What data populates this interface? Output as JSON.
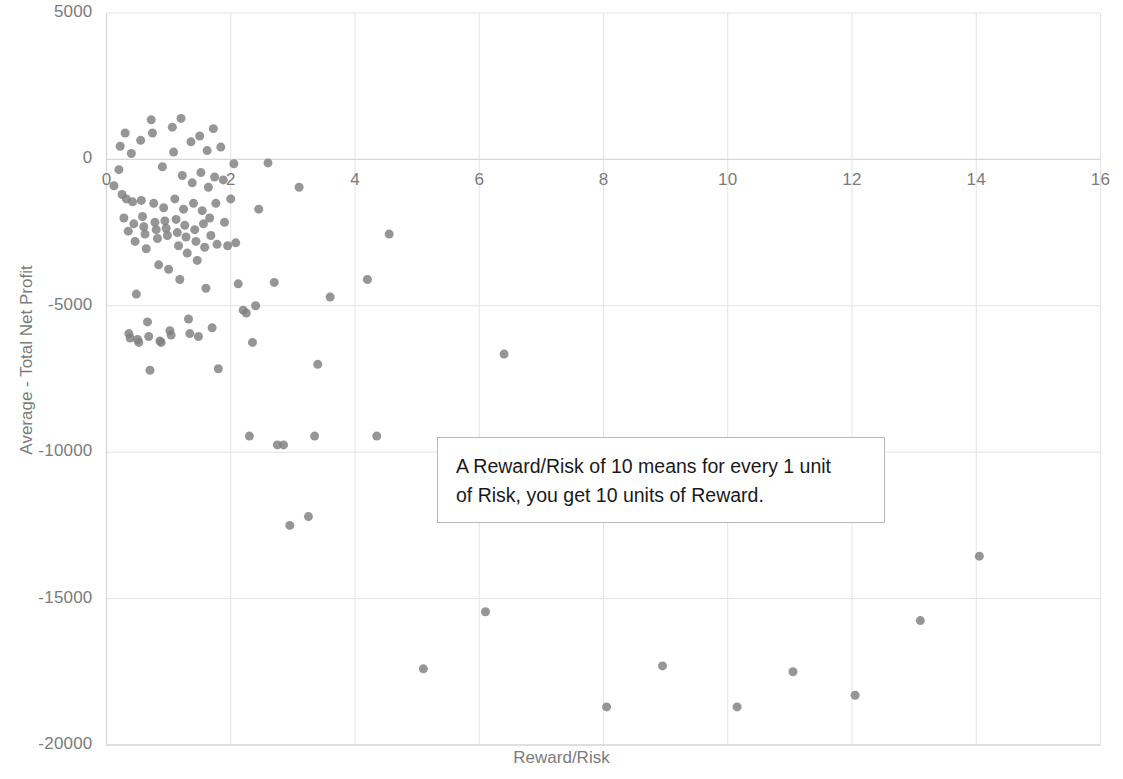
{
  "chart_data": {
    "type": "scatter",
    "title": "",
    "xlabel": "Reward/Risk",
    "ylabel": "Average - Total Net Profit",
    "xlim": [
      0,
      16
    ],
    "ylim": [
      -20000,
      5000
    ],
    "x_ticks": [
      "0",
      "2",
      "4",
      "6",
      "8",
      "10",
      "12",
      "14",
      "16"
    ],
    "x_tick_values": [
      0,
      2,
      4,
      6,
      8,
      10,
      12,
      14,
      16
    ],
    "y_ticks": [
      "5000",
      "0",
      "-5000",
      "-10000",
      "-15000",
      "-20000"
    ],
    "y_tick_values": [
      5000,
      0,
      -5000,
      -10000,
      -15000,
      -20000
    ],
    "grid": true,
    "legend": "none",
    "marker_color": "#7f7f7f",
    "marker_size": 9,
    "points": [
      [
        0.12,
        -900
      ],
      [
        0.2,
        -350
      ],
      [
        0.22,
        450
      ],
      [
        0.25,
        -1200
      ],
      [
        0.28,
        -2000
      ],
      [
        0.3,
        900
      ],
      [
        0.32,
        -1350
      ],
      [
        0.35,
        -2450
      ],
      [
        0.36,
        -5950
      ],
      [
        0.38,
        -6100
      ],
      [
        0.4,
        200
      ],
      [
        0.42,
        -1450
      ],
      [
        0.44,
        -2200
      ],
      [
        0.46,
        -2800
      ],
      [
        0.48,
        -4600
      ],
      [
        0.5,
        -6150
      ],
      [
        0.52,
        -6250
      ],
      [
        0.55,
        650
      ],
      [
        0.56,
        -1400
      ],
      [
        0.58,
        -1950
      ],
      [
        0.6,
        -2300
      ],
      [
        0.62,
        -2550
      ],
      [
        0.64,
        -3050
      ],
      [
        0.66,
        -5550
      ],
      [
        0.68,
        -6050
      ],
      [
        0.7,
        -7200
      ],
      [
        0.72,
        1350
      ],
      [
        0.74,
        900
      ],
      [
        0.76,
        -1500
      ],
      [
        0.78,
        -2150
      ],
      [
        0.8,
        -2400
      ],
      [
        0.82,
        -2700
      ],
      [
        0.84,
        -3600
      ],
      [
        0.86,
        -6200
      ],
      [
        0.88,
        -6250
      ],
      [
        0.9,
        -250
      ],
      [
        0.92,
        -1650
      ],
      [
        0.94,
        -2100
      ],
      [
        0.96,
        -2350
      ],
      [
        0.98,
        -2600
      ],
      [
        1.0,
        -3750
      ],
      [
        1.02,
        -5850
      ],
      [
        1.04,
        -6000
      ],
      [
        1.06,
        1100
      ],
      [
        1.08,
        250
      ],
      [
        1.1,
        -1350
      ],
      [
        1.12,
        -2050
      ],
      [
        1.14,
        -2500
      ],
      [
        1.16,
        -2950
      ],
      [
        1.18,
        -4100
      ],
      [
        1.2,
        1400
      ],
      [
        1.22,
        -550
      ],
      [
        1.24,
        -1700
      ],
      [
        1.26,
        -2250
      ],
      [
        1.28,
        -2650
      ],
      [
        1.3,
        -3200
      ],
      [
        1.32,
        -5450
      ],
      [
        1.34,
        -5950
      ],
      [
        1.36,
        600
      ],
      [
        1.38,
        -800
      ],
      [
        1.4,
        -1500
      ],
      [
        1.42,
        -2400
      ],
      [
        1.44,
        -2800
      ],
      [
        1.46,
        -3450
      ],
      [
        1.48,
        -6050
      ],
      [
        1.5,
        800
      ],
      [
        1.52,
        -450
      ],
      [
        1.54,
        -1750
      ],
      [
        1.56,
        -2200
      ],
      [
        1.58,
        -3000
      ],
      [
        1.6,
        -4400
      ],
      [
        1.62,
        300
      ],
      [
        1.64,
        -950
      ],
      [
        1.66,
        -2000
      ],
      [
        1.68,
        -2600
      ],
      [
        1.7,
        -5750
      ],
      [
        1.72,
        1050
      ],
      [
        1.74,
        -600
      ],
      [
        1.76,
        -1500
      ],
      [
        1.78,
        -2900
      ],
      [
        1.8,
        -7150
      ],
      [
        1.84,
        420
      ],
      [
        1.88,
        -700
      ],
      [
        1.9,
        -2150
      ],
      [
        1.95,
        -2950
      ],
      [
        2.0,
        -1350
      ],
      [
        2.05,
        -150
      ],
      [
        2.08,
        -2850
      ],
      [
        2.12,
        -4250
      ],
      [
        2.2,
        -5150
      ],
      [
        2.25,
        -5250
      ],
      [
        2.3,
        -9450
      ],
      [
        2.35,
        -6250
      ],
      [
        2.4,
        -5000
      ],
      [
        2.45,
        -1700
      ],
      [
        2.6,
        -120
      ],
      [
        2.7,
        -4200
      ],
      [
        2.75,
        -9750
      ],
      [
        2.85,
        -9750
      ],
      [
        2.95,
        -12500
      ],
      [
        3.1,
        -950
      ],
      [
        3.25,
        -12200
      ],
      [
        3.35,
        -9450
      ],
      [
        3.4,
        -7000
      ],
      [
        3.6,
        -4700
      ],
      [
        4.2,
        -4100
      ],
      [
        4.35,
        -9450
      ],
      [
        4.55,
        -2550
      ],
      [
        5.1,
        -17400
      ],
      [
        6.4,
        -6650
      ],
      [
        6.1,
        -15450
      ],
      [
        8.05,
        -18700
      ],
      [
        8.95,
        -17300
      ],
      [
        10.15,
        -18700
      ],
      [
        11.05,
        -17500
      ],
      [
        12.05,
        -18300
      ],
      [
        13.1,
        -15750
      ],
      [
        14.05,
        -13550
      ]
    ]
  },
  "annotation": {
    "line1": "A Reward/Risk of 10 means for every 1 unit",
    "line2": "of Risk, you get 10 units of Reward."
  },
  "axis_colors": {
    "tick_text": "#7b7b7b",
    "grid": "#e3e3e3",
    "axis_line": "#d8d8d8"
  }
}
